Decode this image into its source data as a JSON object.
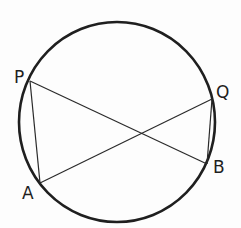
{
  "diagram": {
    "type": "circle-geometry",
    "circle": {
      "cx": 117,
      "cy": 122,
      "rx": 98,
      "ry": 100,
      "stroke": "#1f1f1f",
      "stroke_width": 2.6
    },
    "points": [
      {
        "name": "P",
        "x": 30,
        "y": 81,
        "label_x": 14,
        "label_y": 83
      },
      {
        "name": "Q",
        "x": 212,
        "y": 99,
        "label_x": 216,
        "label_y": 98
      },
      {
        "name": "B",
        "x": 207,
        "y": 164,
        "label_x": 213,
        "label_y": 173
      },
      {
        "name": "A",
        "x": 40,
        "y": 183,
        "label_x": 22,
        "label_y": 199
      }
    ],
    "segments": [
      {
        "from": "P",
        "to": "A"
      },
      {
        "from": "P",
        "to": "B"
      },
      {
        "from": "A",
        "to": "Q"
      },
      {
        "from": "Q",
        "to": "B"
      }
    ],
    "segment_color": "#2a2a2a",
    "segment_width": 1.2,
    "labels": {
      "P": "P",
      "Q": "Q",
      "B": "B",
      "A": "A"
    }
  }
}
